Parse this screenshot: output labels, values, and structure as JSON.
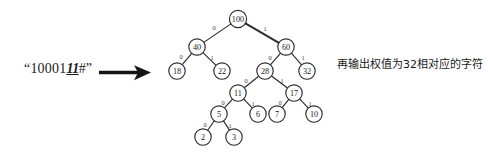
{
  "input": {
    "open_quote": "“",
    "prefix": "10001",
    "emphasis": "11",
    "suffix": "#",
    "close_quote": "”"
  },
  "arrow": {
    "icon": "right-arrow-icon"
  },
  "annotation": {
    "text": "再输出权值为32相对应的字符"
  },
  "colors": {
    "ink": "#2b2b2b",
    "text": "#1a1a1a",
    "background": "#ffffff"
  },
  "chart_data": {
    "type": "diagram",
    "diagram_kind": "binary-huffman-decode-tree",
    "title": "",
    "edge_label_meaning": {
      "0": "left branch",
      "1": "right branch"
    },
    "nodes": [
      {
        "id": "n100",
        "label": "100",
        "cx": 238,
        "cy": 19,
        "r": 8.6
      },
      {
        "id": "n40",
        "label": "40",
        "cx": 197,
        "cy": 47,
        "r": 8.2
      },
      {
        "id": "n60",
        "label": "60",
        "cx": 286,
        "cy": 47,
        "r": 8.2
      },
      {
        "id": "n18",
        "label": "18",
        "cx": 177,
        "cy": 71,
        "r": 8.2
      },
      {
        "id": "n22",
        "label": "22",
        "cx": 222,
        "cy": 71,
        "r": 8.2
      },
      {
        "id": "n28",
        "label": "28",
        "cx": 265,
        "cy": 71,
        "r": 8.2
      },
      {
        "id": "n32",
        "label": "32",
        "cx": 307,
        "cy": 71,
        "r": 8.2
      },
      {
        "id": "n11",
        "label": "11",
        "cx": 238,
        "cy": 93,
        "r": 8.2
      },
      {
        "id": "n17",
        "label": "17",
        "cx": 294,
        "cy": 93,
        "r": 8.2
      },
      {
        "id": "n5",
        "label": "5",
        "cx": 219,
        "cy": 114,
        "r": 8.2
      },
      {
        "id": "n6",
        "label": "6",
        "cx": 258,
        "cy": 114,
        "r": 8.2
      },
      {
        "id": "n7",
        "label": "7",
        "cx": 277,
        "cy": 114,
        "r": 8.2
      },
      {
        "id": "n10",
        "label": "10",
        "cx": 314,
        "cy": 114,
        "r": 8.2
      },
      {
        "id": "n2",
        "label": "2",
        "cx": 203,
        "cy": 137,
        "r": 8.2
      },
      {
        "id": "n3",
        "label": "3",
        "cx": 234,
        "cy": 137,
        "r": 8.2
      }
    ],
    "edges": [
      {
        "from": "n100",
        "to": "n40",
        "label": "0",
        "lx": 214,
        "ly": 27,
        "thick": false
      },
      {
        "from": "n100",
        "to": "n60",
        "label": "1",
        "lx": 265,
        "ly": 28,
        "thick": true
      },
      {
        "from": "n40",
        "to": "n18",
        "label": "0",
        "lx": 181,
        "ly": 56,
        "thick": false
      },
      {
        "from": "n40",
        "to": "n22",
        "label": "1",
        "lx": 212,
        "ly": 57,
        "thick": false
      },
      {
        "from": "n60",
        "to": "n28",
        "label": "0",
        "lx": 270,
        "ly": 57,
        "thick": false
      },
      {
        "from": "n60",
        "to": "n32",
        "label": "1",
        "lx": 303,
        "ly": 57,
        "thick": false
      },
      {
        "from": "n28",
        "to": "n11",
        "label": "0",
        "lx": 246,
        "ly": 80,
        "thick": false
      },
      {
        "from": "n28",
        "to": "n17",
        "label": "1",
        "lx": 282,
        "ly": 80,
        "thick": false
      },
      {
        "from": "n11",
        "to": "n5",
        "label": "0",
        "lx": 223,
        "ly": 102,
        "thick": false
      },
      {
        "from": "n11",
        "to": "n6",
        "label": "1",
        "lx": 253,
        "ly": 103,
        "thick": false
      },
      {
        "from": "n17",
        "to": "n7",
        "label": "0",
        "lx": 280,
        "ly": 102,
        "thick": false
      },
      {
        "from": "n17",
        "to": "n10",
        "label": "1",
        "lx": 310,
        "ly": 103,
        "thick": false
      },
      {
        "from": "n5",
        "to": "n2",
        "label": "0",
        "lx": 205,
        "ly": 124,
        "thick": false
      },
      {
        "from": "n5",
        "to": "n3",
        "label": "1",
        "lx": 230,
        "ly": 125,
        "thick": false
      }
    ]
  }
}
